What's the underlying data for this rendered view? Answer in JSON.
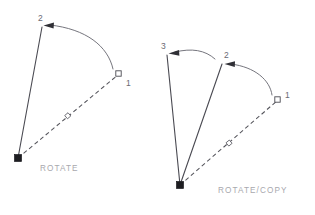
{
  "figure": {
    "background_color": "#ffffff",
    "line_color": "#4a4a52",
    "arc_color": "#6e6e76",
    "caption_color": "#a8a8ae",
    "label_color": "#6a6a72",
    "node_fill_color": "#1d1d21"
  },
  "panels": [
    {
      "id": "rotate",
      "caption": "ROTATE",
      "caption_pos": {
        "x": 40,
        "y": 171
      },
      "base_point": {
        "x": 18,
        "y": 158,
        "marker": "filled-square"
      },
      "reference_point": {
        "x": 119,
        "y": 74,
        "marker": "open-square",
        "label": "1",
        "label_pos": {
          "x": 126,
          "y": 85
        }
      },
      "midpoint_marker": {
        "x": 68,
        "y": 116,
        "marker": "small-open-square"
      },
      "rays": [
        {
          "id": "reference-ray",
          "style": "dashed",
          "from": {
            "x": 18,
            "y": 158
          },
          "to": {
            "x": 119,
            "y": 74
          }
        },
        {
          "id": "rotated-ray",
          "style": "solid",
          "from": {
            "x": 18,
            "y": 158
          },
          "to": {
            "x": 42,
            "y": 27
          },
          "label": "2",
          "label_pos": {
            "x": 40,
            "y": 21
          }
        }
      ],
      "arcs": [
        {
          "id": "rotation-arc",
          "path": "M 112 70 Q 104 33 49 25",
          "arrow_at": {
            "x": 49,
            "y": 25
          },
          "arrow_dir": "left"
        }
      ]
    },
    {
      "id": "rotate-copy",
      "caption": "ROTATE/COPY",
      "caption_pos": {
        "x": 218,
        "y": 192
      },
      "base_point": {
        "x": 180,
        "y": 185,
        "marker": "filled-square"
      },
      "reference_point": {
        "x": 278,
        "y": 100,
        "marker": "open-square",
        "label": "1",
        "label_pos": {
          "x": 285,
          "y": 97
        }
      },
      "midpoint_marker": {
        "x": 229,
        "y": 143,
        "marker": "small-open-square"
      },
      "rays": [
        {
          "id": "reference-ray",
          "style": "dashed",
          "from": {
            "x": 180,
            "y": 185
          },
          "to": {
            "x": 278,
            "y": 100
          }
        },
        {
          "id": "copy-ray-2",
          "style": "solid",
          "from": {
            "x": 180,
            "y": 185
          },
          "to": {
            "x": 222,
            "y": 64
          },
          "label": "2",
          "label_pos": {
            "x": 226,
            "y": 58
          }
        },
        {
          "id": "copy-ray-3",
          "style": "solid",
          "from": {
            "x": 180,
            "y": 185
          },
          "to": {
            "x": 167,
            "y": 55
          },
          "label": "3",
          "label_pos": {
            "x": 163,
            "y": 50
          }
        }
      ],
      "arcs": [
        {
          "id": "rotation-arc-1",
          "path": "M 271 96 Q 268 75 230 64",
          "arrow_at": {
            "x": 230,
            "y": 64
          },
          "arrow_dir": "left"
        },
        {
          "id": "rotation-arc-2",
          "path": "M 215 60 Q 200 48 174 53",
          "arrow_at": {
            "x": 174,
            "y": 53
          },
          "arrow_dir": "left"
        }
      ]
    }
  ]
}
